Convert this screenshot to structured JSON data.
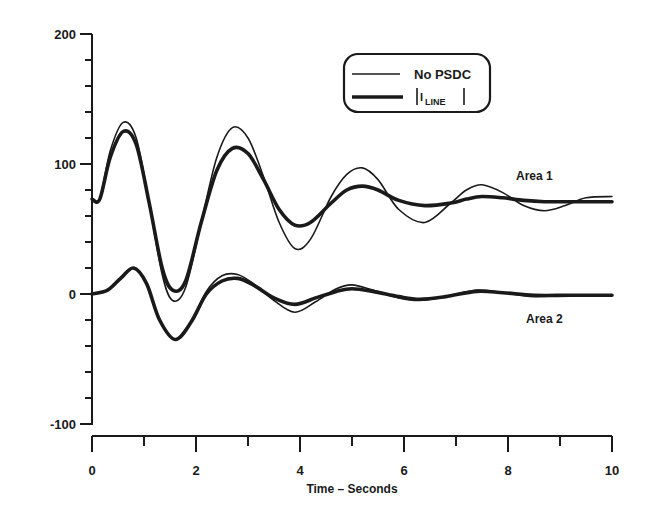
{
  "chart_data": {
    "type": "line",
    "title": "",
    "xlabel": "Time – Seconds",
    "ylabel": "",
    "xlim": [
      0,
      10
    ],
    "ylim": [
      -100,
      200
    ],
    "x_ticks": [
      0,
      2,
      4,
      6,
      8,
      10
    ],
    "y_ticks": [
      -100,
      0,
      100,
      200
    ],
    "grid": false,
    "legend_position": "top-right",
    "legend": [
      {
        "label": "No PSDC",
        "style": "thin"
      },
      {
        "label": "|I_LINE|",
        "style": "thick"
      }
    ],
    "annotations": [
      {
        "text": "Area 1",
        "x": 8.6,
        "y": 88
      },
      {
        "text": "Area 2",
        "x": 8.6,
        "y": -20
      }
    ],
    "series": [
      {
        "name": "Area 1 – No PSDC",
        "style": "thin",
        "x": [
          0,
          0.15,
          0.35,
          0.6,
          0.85,
          1.1,
          1.35,
          1.55,
          1.8,
          2.1,
          2.4,
          2.7,
          3.0,
          3.3,
          3.6,
          3.9,
          4.2,
          4.6,
          4.9,
          5.2,
          5.5,
          5.9,
          6.4,
          6.9,
          7.2,
          7.5,
          7.9,
          8.3,
          8.7,
          9.1,
          9.5,
          10
        ],
        "y": [
          73,
          73,
          110,
          132,
          120,
          70,
          15,
          -5,
          5,
          55,
          105,
          128,
          120,
          90,
          55,
          35,
          42,
          75,
          92,
          97,
          88,
          65,
          55,
          70,
          80,
          84,
          78,
          68,
          64,
          68,
          74,
          75
        ]
      },
      {
        "name": "Area 1 – |I_LINE|",
        "style": "thick",
        "x": [
          0,
          0.15,
          0.35,
          0.6,
          0.85,
          1.1,
          1.35,
          1.55,
          1.8,
          2.1,
          2.4,
          2.7,
          3.0,
          3.3,
          3.6,
          3.9,
          4.2,
          4.6,
          4.9,
          5.2,
          5.5,
          5.9,
          6.4,
          6.9,
          7.2,
          7.5,
          7.9,
          8.3,
          8.7,
          9.1,
          9.5,
          10
        ],
        "y": [
          73,
          73,
          105,
          125,
          115,
          70,
          20,
          3,
          10,
          55,
          95,
          112,
          108,
          88,
          65,
          53,
          55,
          70,
          80,
          83,
          80,
          72,
          68,
          70,
          73,
          75,
          74,
          72,
          71,
          71,
          71,
          71
        ]
      },
      {
        "name": "Area 2 – No PSDC",
        "style": "thin",
        "x": [
          0,
          0.3,
          0.55,
          0.8,
          1.05,
          1.3,
          1.6,
          1.9,
          2.2,
          2.5,
          2.8,
          3.1,
          3.5,
          3.9,
          4.3,
          4.7,
          5.0,
          5.4,
          5.9,
          6.3,
          6.8,
          7.4,
          7.9,
          8.5,
          9.2,
          10
        ],
        "y": [
          0,
          3,
          12,
          20,
          8,
          -20,
          -35,
          -22,
          2,
          14,
          15,
          8,
          -5,
          -14,
          -6,
          4,
          7,
          3,
          -3,
          -5,
          -2,
          3,
          1,
          -2,
          -1,
          -1
        ]
      },
      {
        "name": "Area 2 – |I_LINE|",
        "style": "thick",
        "x": [
          0,
          0.3,
          0.55,
          0.8,
          1.05,
          1.3,
          1.6,
          1.9,
          2.2,
          2.5,
          2.8,
          3.1,
          3.5,
          3.9,
          4.3,
          4.7,
          5.0,
          5.4,
          5.9,
          6.3,
          6.8,
          7.4,
          7.9,
          8.5,
          9.2,
          10
        ],
        "y": [
          0,
          3,
          12,
          20,
          8,
          -20,
          -35,
          -22,
          0,
          10,
          12,
          7,
          -3,
          -8,
          -3,
          2,
          4,
          2,
          -2,
          -4,
          -2,
          2,
          1,
          -1,
          -1,
          -1
        ]
      }
    ]
  },
  "legend": {
    "item1": "No PSDC",
    "item2_main": "I",
    "item2_sub": "LINE"
  },
  "axes": {
    "x_title": "Time – Seconds",
    "x_tick_labels": [
      "0",
      "2",
      "4",
      "6",
      "8",
      "10"
    ],
    "y_tick_labels": [
      "200",
      "100",
      "0",
      "-100"
    ]
  },
  "annotations": {
    "area1": "Area 1",
    "area2": "Area 2"
  }
}
